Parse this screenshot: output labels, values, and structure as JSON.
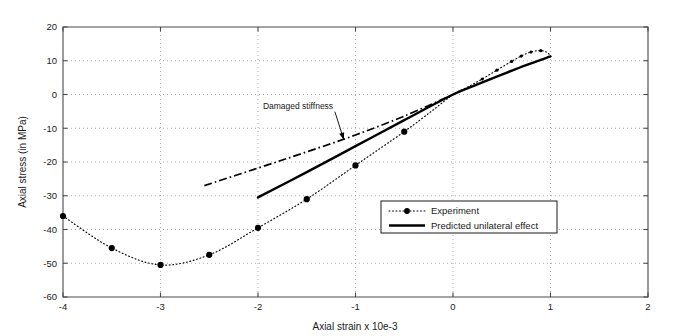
{
  "chart_data": {
    "type": "line",
    "title": "",
    "xlabel": "Axial strain x 10e-3",
    "ylabel": "Axial stress (in MPa)",
    "xlim": [
      -4,
      2
    ],
    "ylim": [
      -60,
      20
    ],
    "xticks": [
      -4,
      -3,
      -2,
      -1,
      0,
      1,
      2
    ],
    "xticklabels": [
      "-4",
      "-3",
      "-2",
      "-1",
      "0",
      "1",
      "2"
    ],
    "yticks": [
      -60,
      -50,
      -40,
      -30,
      -20,
      -10,
      0,
      10,
      20
    ],
    "yticklabels": [
      "-60",
      "-50",
      "-40",
      "-30",
      "-20",
      "-10",
      "0",
      "10",
      "20"
    ],
    "grid": true,
    "grid_style": "dotted",
    "legend_position": "lower right",
    "series": [
      {
        "name": "Experiment",
        "style": "dotted-with-markers",
        "markers": true,
        "points": [
          [
            -4.0,
            -36.0
          ],
          [
            -3.5,
            -45.5
          ],
          [
            -3.0,
            -50.5
          ],
          [
            -2.5,
            -47.5
          ],
          [
            -2.0,
            -39.5
          ],
          [
            -1.5,
            -31.0
          ],
          [
            -1.0,
            -21.0
          ],
          [
            -0.5,
            -11.0
          ],
          [
            -0.2,
            -4.5
          ],
          [
            0.0,
            0.0
          ],
          [
            0.15,
            2.2
          ],
          [
            0.3,
            4.6
          ],
          [
            0.45,
            7.2
          ],
          [
            0.6,
            9.8
          ],
          [
            0.7,
            11.4
          ],
          [
            0.8,
            12.6
          ],
          [
            0.9,
            13.0
          ],
          [
            0.97,
            12.4
          ],
          [
            1.0,
            11.2
          ]
        ]
      },
      {
        "name": "Predicted unilateral effect",
        "style": "solid",
        "markers": false,
        "points": [
          [
            -2.0,
            -30.5
          ],
          [
            -1.5,
            -23.0
          ],
          [
            -1.0,
            -15.3
          ],
          [
            -0.5,
            -7.6
          ],
          [
            0.0,
            0.0
          ],
          [
            0.25,
            3.0
          ],
          [
            0.5,
            5.9
          ],
          [
            0.75,
            8.7
          ],
          [
            1.0,
            11.3
          ]
        ]
      },
      {
        "name": "Damaged stiffness",
        "style": "dash-dot",
        "markers": false,
        "points": [
          [
            -2.55,
            -27.0
          ],
          [
            -2.0,
            -21.8
          ],
          [
            -1.5,
            -17.0
          ],
          [
            -1.0,
            -12.0
          ],
          [
            -0.5,
            -6.4
          ],
          [
            0.0,
            0.0
          ]
        ]
      }
    ],
    "annotations": [
      {
        "text": "Damaged stiffness",
        "text_x": -1.95,
        "text_y": -4.2,
        "arrow_to_x": -1.12,
        "arrow_to_y": -13.4
      }
    ]
  },
  "legend": {
    "entries": [
      {
        "label": "Experiment",
        "style": "dotted-with-marker"
      },
      {
        "label": "Predicted unilateral effect",
        "style": "solid"
      }
    ]
  }
}
